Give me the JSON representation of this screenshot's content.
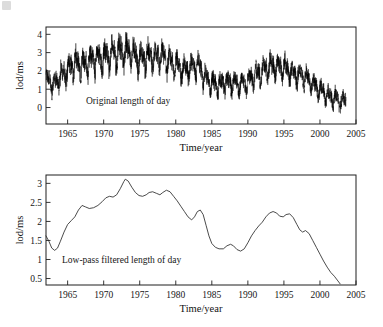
{
  "figure": {
    "panels": [
      "top",
      "bottom"
    ]
  },
  "chart_data": [
    {
      "type": "line",
      "id": "original-lod",
      "title": "",
      "annotation": "Original length of day",
      "xlabel": "Time/year",
      "ylabel": "lod/ms",
      "xlim": [
        1962,
        2005
      ],
      "ylim": [
        -0.9,
        4.4
      ],
      "xticks": [
        1965,
        1970,
        1975,
        1980,
        1985,
        1990,
        1995,
        2000,
        2005
      ],
      "xticklabels": [
        "1965",
        "1970",
        "1975",
        "1980",
        "1985",
        "1990",
        "1995",
        "2000",
        "2005"
      ],
      "yticks": [
        0,
        1,
        2,
        3,
        4
      ],
      "yticklabels": [
        "0",
        "1",
        "2",
        "3",
        "4"
      ],
      "grid": false,
      "legend": "none",
      "series": [
        {
          "name": "Original length of day",
          "color": "#000000",
          "description": "Daily length-of-day residual with strong annual and semi-annual oscillations superimposed on the decadal trend.",
          "trend_x": [
            1962.0,
            1963.0,
            1964.0,
            1965.0,
            1966.0,
            1967.0,
            1968.0,
            1969.0,
            1970.0,
            1971.0,
            1972.0,
            1973.0,
            1974.0,
            1975.0,
            1976.0,
            1977.0,
            1978.0,
            1979.0,
            1980.0,
            1981.0,
            1982.0,
            1983.0,
            1984.0,
            1985.0,
            1986.0,
            1987.0,
            1988.0,
            1989.0,
            1990.0,
            1991.0,
            1992.0,
            1993.0,
            1994.0,
            1995.0,
            1996.0,
            1997.0,
            1998.0,
            1999.0,
            2000.0,
            2001.0,
            2002.0,
            2003.0,
            2003.6
          ],
          "trend_y": [
            1.6,
            1.25,
            1.75,
            2.05,
            2.4,
            2.35,
            2.5,
            2.68,
            2.72,
            2.85,
            3.0,
            3.1,
            2.9,
            2.68,
            2.78,
            2.72,
            2.8,
            2.55,
            2.3,
            2.05,
            2.18,
            2.3,
            1.7,
            1.28,
            1.22,
            1.4,
            1.3,
            1.24,
            1.45,
            1.75,
            2.0,
            2.22,
            2.18,
            2.22,
            1.95,
            1.75,
            1.7,
            1.25,
            0.95,
            0.7,
            0.5,
            0.35,
            0.28
          ],
          "oscillation_amplitude": [
            0.55,
            0.62,
            0.7,
            0.78,
            0.82,
            0.8,
            0.82,
            0.85,
            0.88,
            0.9,
            0.92,
            0.9,
            0.86,
            0.82,
            0.84,
            0.82,
            0.8,
            0.76,
            0.72,
            0.7,
            0.72,
            0.74,
            0.7,
            0.66,
            0.64,
            0.66,
            0.64,
            0.62,
            0.64,
            0.68,
            0.72,
            0.74,
            0.72,
            0.72,
            0.68,
            0.64,
            0.62,
            0.58,
            0.56,
            0.55,
            0.56,
            0.58,
            0.58
          ],
          "approx_max": 4.15,
          "approx_min": -0.75
        }
      ]
    },
    {
      "type": "line",
      "id": "lowpass-lod",
      "title": "",
      "annotation": "Low-pass filtered length of day",
      "xlabel": "Time/year",
      "ylabel": "lod/ms",
      "xlim": [
        1962,
        2005
      ],
      "ylim": [
        0.33,
        3.22
      ],
      "xticks": [
        1965,
        1970,
        1975,
        1980,
        1985,
        1990,
        1995,
        2000,
        2005
      ],
      "xticklabels": [
        "1965",
        "1970",
        "1975",
        "1980",
        "1985",
        "1990",
        "1995",
        "2000",
        "2005"
      ],
      "yticks": [
        0.5,
        1,
        1.5,
        2,
        2.5,
        3
      ],
      "yticklabels": [
        "0.5",
        "1",
        "1.5",
        "2",
        "2.5",
        "3"
      ],
      "grid": false,
      "legend": "none",
      "series": [
        {
          "name": "Low-pass filtered length of day",
          "color": "#2a2a2a",
          "x": [
            1962.0,
            1962.4,
            1962.8,
            1963.2,
            1963.6,
            1964.0,
            1964.5,
            1965.0,
            1965.5,
            1966.0,
            1966.5,
            1967.0,
            1967.5,
            1968.0,
            1968.6,
            1969.2,
            1969.8,
            1970.3,
            1970.8,
            1971.3,
            1971.8,
            1972.3,
            1972.8,
            1973.0,
            1973.4,
            1973.9,
            1974.4,
            1974.9,
            1975.4,
            1975.9,
            1976.3,
            1976.8,
            1977.3,
            1977.8,
            1978.2,
            1978.7,
            1979.2,
            1979.7,
            1980.2,
            1980.7,
            1981.2,
            1981.7,
            1982.2,
            1982.6,
            1983.0,
            1983.4,
            1983.8,
            1984.2,
            1984.6,
            1985.0,
            1985.5,
            1986.0,
            1986.6,
            1987.1,
            1987.6,
            1988.0,
            1988.5,
            1989.0,
            1989.5,
            1990.0,
            1990.5,
            1991.0,
            1991.5,
            1992.0,
            1992.5,
            1993.0,
            1993.5,
            1994.0,
            1994.4,
            1994.9,
            1995.3,
            1995.8,
            1996.3,
            1996.8,
            1997.2,
            1997.6,
            1998.0,
            1998.5,
            1999.0,
            1999.5,
            2000.0,
            2000.5,
            2001.0,
            2001.5,
            2002.0,
            2002.4,
            2002.8
          ],
          "y": [
            1.62,
            1.48,
            1.3,
            1.24,
            1.3,
            1.48,
            1.72,
            1.92,
            2.02,
            2.12,
            2.3,
            2.42,
            2.38,
            2.34,
            2.36,
            2.42,
            2.52,
            2.62,
            2.66,
            2.64,
            2.7,
            2.86,
            3.05,
            3.11,
            3.06,
            2.9,
            2.76,
            2.68,
            2.66,
            2.7,
            2.76,
            2.78,
            2.74,
            2.7,
            2.76,
            2.82,
            2.78,
            2.66,
            2.54,
            2.4,
            2.26,
            2.12,
            2.04,
            2.12,
            2.26,
            2.3,
            2.18,
            1.9,
            1.62,
            1.42,
            1.32,
            1.28,
            1.28,
            1.36,
            1.4,
            1.36,
            1.26,
            1.22,
            1.28,
            1.44,
            1.62,
            1.76,
            1.88,
            1.98,
            2.12,
            2.22,
            2.26,
            2.22,
            2.14,
            2.12,
            2.18,
            2.2,
            2.1,
            1.92,
            1.78,
            1.72,
            1.76,
            1.68,
            1.5,
            1.32,
            1.14,
            0.96,
            0.8,
            0.66,
            0.56,
            0.46,
            0.36
          ],
          "approx_max": 3.11,
          "approx_min": 0.36
        }
      ]
    }
  ]
}
